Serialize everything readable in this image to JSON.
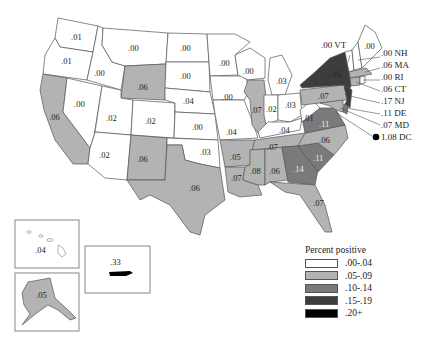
{
  "legend": {
    "title": "Percent positive",
    "bins": [
      {
        "label": ".00-.04",
        "color": "#ffffff"
      },
      {
        "label": ".05-.09",
        "color": "#b3b3b3"
      },
      {
        "label": ".10-.14",
        "color": "#7a7a7a"
      },
      {
        "label": ".15-.19",
        "color": "#3d3d3d"
      },
      {
        "label": ".20+",
        "color": "#000000"
      }
    ]
  },
  "states": {
    "WA": ".01",
    "OR": ".01",
    "CA": ".06",
    "NV": ".00",
    "ID": ".00",
    "MT": ".00",
    "WY": ".06",
    "UT": ".02",
    "AZ": ".02",
    "CO": ".02",
    "NM": ".06",
    "ND": ".00",
    "SD": ".00",
    "NE": ".04",
    "KS": ".00",
    "OK": ".03",
    "TX": ".06",
    "MN": ".00",
    "IA": ".00",
    "MO": ".04",
    "AR": ".05",
    "LA": ".07",
    "WI": ".00",
    "IL": ".07",
    "MI": ".03",
    "IN": ".02",
    "OH": ".03",
    "KY": ".04",
    "TN": ".07",
    "MS": ".08",
    "AL": ".06",
    "GA": ".14",
    "FL": ".07",
    "SC": ".11",
    "NC": ".06",
    "VA": ".11",
    "WV": ".01",
    "PA": ".07",
    "NY": ".16",
    "ME": ".00",
    "AK": ".05",
    "HI": ".04",
    "PR": ".33"
  },
  "callouts": [
    {
      "label": ".00 VT"
    },
    {
      "label": ".00 NH"
    },
    {
      "label": ".06 MA"
    },
    {
      "label": ".00 RI"
    },
    {
      "label": ".06 CT"
    },
    {
      "label": ".17 NJ"
    },
    {
      "label": ".11 DE"
    },
    {
      "label": ".07 MD"
    },
    {
      "label": "1.08 DC"
    }
  ]
}
